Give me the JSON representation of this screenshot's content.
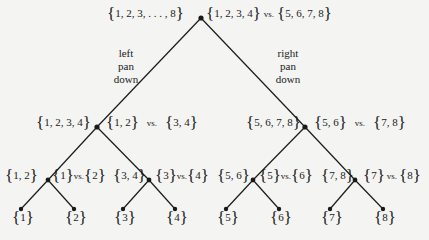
{
  "diagram": {
    "type": "binary-search-tree",
    "root": {
      "set": "1, 2, 3, . . . , 8",
      "test_left": "1, 2, 3, 4",
      "vs": "vs.",
      "test_right": "5, 6, 7, 8"
    },
    "branch_labels": {
      "left": [
        "left",
        "pan",
        "down"
      ],
      "right": [
        "right",
        "pan",
        "down"
      ]
    },
    "level2": [
      {
        "set": "1, 2, 3, 4",
        "test_left": "1, 2",
        "vs": "vs.",
        "test_right": "3, 4"
      },
      {
        "set": "5, 6, 7, 8",
        "test_left": "5, 6",
        "vs": "vs.",
        "test_right": "7, 8"
      }
    ],
    "level3": [
      {
        "set": "1, 2",
        "test_left": "1",
        "vs": "vs.",
        "test_right": "2"
      },
      {
        "set": "3, 4",
        "test_left": "3",
        "vs": "vs.",
        "test_right": "4"
      },
      {
        "set": "5, 6",
        "test_left": "5",
        "vs": "vs.",
        "test_right": "6"
      },
      {
        "set": "7, 8",
        "test_left": "7",
        "vs": "vs.",
        "test_right": "8"
      }
    ],
    "leaves": [
      "1",
      "2",
      "3",
      "4",
      "5",
      "6",
      "7",
      "8"
    ],
    "colors": {
      "line": "#1a1a1a",
      "background": "#f4f4f2"
    }
  }
}
